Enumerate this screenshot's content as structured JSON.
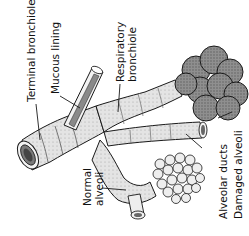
{
  "diagram": {
    "labels": {
      "terminal_bronchiole": "Terminal bronchiole",
      "mucous_lining": "Mucous lining",
      "respiratory_bronchiole_line1": "Respiratory",
      "respiratory_bronchiole_line2": "bronchiole",
      "normal_alveoli_line1": "Normal",
      "normal_alveoli_line2": "alveoli",
      "alveolar_ducts": "Alveolar ducts",
      "damaged_alveoli": "Damaged alveoli"
    },
    "colors": {
      "line": "#1a1a1a",
      "tube_fill": "#e6e6e6",
      "tube_shade": "#bdbdbd",
      "alveoli_fill": "#9a9a9a",
      "lumen": "#555555",
      "background": "#ffffff"
    }
  }
}
